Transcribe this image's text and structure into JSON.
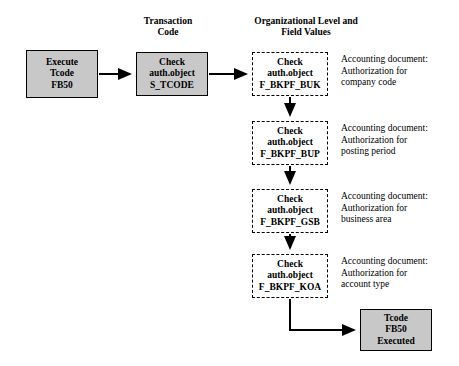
{
  "diagram": {
    "headers": [
      {
        "text": "Transaction\nCode",
        "x": 128,
        "y": 16,
        "w": 80
      },
      {
        "text": "Organizational Level and\nField Values",
        "x": 236,
        "y": 16,
        "w": 140
      }
    ],
    "boxes": [
      {
        "id": "execute-tcode",
        "text": "Execute\nTcode\nFB50",
        "style": "solid",
        "x": 26,
        "y": 50,
        "w": 72,
        "h": 48
      },
      {
        "id": "check-s-tcode",
        "text": "Check\nauth.object\nS_TCODE",
        "style": "solid",
        "x": 136,
        "y": 52,
        "w": 72,
        "h": 44
      },
      {
        "id": "check-f-bkpf-buk",
        "text": "Check\nauth.object\nF_BKPF_BUK",
        "style": "dashed",
        "x": 252,
        "y": 52,
        "w": 76,
        "h": 44
      },
      {
        "id": "check-f-bkpf-bup",
        "text": "Check\nauth.object\nF_BKPF_BUP",
        "style": "dashed",
        "x": 252,
        "y": 121,
        "w": 76,
        "h": 44
      },
      {
        "id": "check-f-bkpf-gsb",
        "text": "Check\nauth.object\nF_BKPF_GSB",
        "style": "dashed",
        "x": 252,
        "y": 189,
        "w": 76,
        "h": 44
      },
      {
        "id": "check-f-bkpf-koa",
        "text": "Check\nauth.object\nF_BKPF_KOA",
        "style": "dashed",
        "x": 252,
        "y": 254,
        "w": 76,
        "h": 44
      },
      {
        "id": "tcode-executed",
        "text": "Tcode\nFB50\nExecuted",
        "style": "solid",
        "x": 360,
        "y": 309,
        "w": 72,
        "h": 42
      }
    ],
    "notes": [
      {
        "id": "note-company-code",
        "text": "Accounting document:\nAuthorization for\ncompany code",
        "x": 341,
        "y": 54,
        "w": 118
      },
      {
        "id": "note-posting-period",
        "text": "Accounting document:\nAuthorization for\nposting period",
        "x": 341,
        "y": 123,
        "w": 118
      },
      {
        "id": "note-business-area",
        "text": "Accounting document:\nAuthorization for\nbusiness area",
        "x": 341,
        "y": 191,
        "w": 118
      },
      {
        "id": "note-account-type",
        "text": "Accounting document:\nAuthorization for\naccount type",
        "x": 341,
        "y": 256,
        "w": 118
      }
    ],
    "connectors": [
      {
        "id": "arrow-execute-to-tcode",
        "points": "99,74 131,74",
        "arrow": true
      },
      {
        "id": "arrow-tcode-to-buk",
        "points": "209,74 247,74",
        "arrow": true
      },
      {
        "id": "arrow-buk-to-bup",
        "points": "290,97 290,116",
        "arrow": true
      },
      {
        "id": "arrow-bup-to-gsb",
        "points": "290,166 290,184",
        "arrow": true
      },
      {
        "id": "arrow-gsb-to-koa",
        "points": "290,234 290,249",
        "arrow": true
      },
      {
        "id": "arrow-koa-to-executed",
        "points": "290,299 290,330 355,330",
        "arrow": true
      }
    ]
  }
}
